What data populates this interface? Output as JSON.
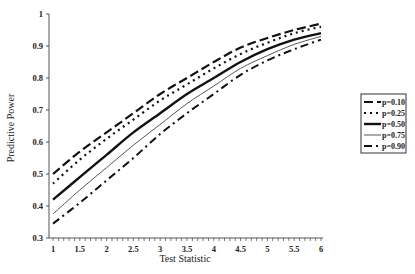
{
  "chart_data": {
    "type": "line",
    "title": "",
    "xlabel": "Test Statistic",
    "ylabel": "Predictive Power",
    "xlim": [
      1,
      6
    ],
    "ylim": [
      0.3,
      1
    ],
    "x_ticks": [
      "1",
      "1.5",
      "2",
      "2.5",
      "3",
      "3.5",
      "4",
      "4.5",
      "5",
      "5.5",
      "6"
    ],
    "y_ticks": [
      "0.3",
      "0.4",
      "0.5",
      "0.6",
      "0.7",
      "0.8",
      "0.9",
      "1"
    ],
    "grid": false,
    "legend_position": "right",
    "x": [
      1,
      1.5,
      2,
      2.5,
      3,
      3.5,
      4,
      4.5,
      5,
      5.5,
      6
    ],
    "series": [
      {
        "name": "p=0.10",
        "style": "long-dash",
        "values": [
          0.5,
          0.57,
          0.63,
          0.69,
          0.75,
          0.8,
          0.85,
          0.895,
          0.925,
          0.95,
          0.97
        ]
      },
      {
        "name": "p=0.25",
        "style": "dotted",
        "values": [
          0.47,
          0.545,
          0.61,
          0.67,
          0.73,
          0.78,
          0.83,
          0.875,
          0.91,
          0.94,
          0.96
        ]
      },
      {
        "name": "p=0.50",
        "style": "thick-solid",
        "values": [
          0.42,
          0.49,
          0.56,
          0.63,
          0.69,
          0.75,
          0.8,
          0.85,
          0.89,
          0.92,
          0.94
        ]
      },
      {
        "name": "p=0.75",
        "style": "thin-solid",
        "values": [
          0.375,
          0.45,
          0.52,
          0.59,
          0.655,
          0.72,
          0.775,
          0.83,
          0.87,
          0.905,
          0.93
        ]
      },
      {
        "name": "p=0.90",
        "style": "dash-dot",
        "values": [
          0.345,
          0.41,
          0.48,
          0.55,
          0.625,
          0.69,
          0.75,
          0.81,
          0.855,
          0.89,
          0.92
        ]
      }
    ]
  }
}
